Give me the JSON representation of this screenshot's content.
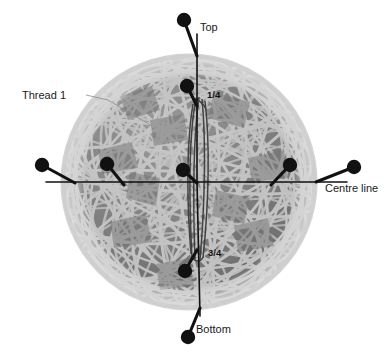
{
  "figure": {
    "type": "technical-illustration",
    "canvas": {
      "width": 391,
      "height": 363,
      "background": "#ffffff"
    }
  },
  "ball": {
    "name": "wound-ball",
    "center": {
      "x": 189,
      "y": 182
    },
    "radius": 127,
    "base_color": "#7b7b7b",
    "strand_color": "#c9c9c9",
    "highlight_color": "#d7d7d7",
    "shadow_color": "#6a6a6a",
    "rim_color": "#bfbfbf"
  },
  "axes": {
    "vertical": {
      "name": "vertical-axis",
      "label_top": "Top",
      "label_bottom": "Bottom",
      "color": "#111111"
    },
    "horizontal": {
      "name": "centre-line-axis",
      "label": "Centre line",
      "color": "#111111"
    }
  },
  "labels": {
    "top": "Top",
    "bottom": "Bottom",
    "centre_line": "Centre line",
    "thread_1": "Thread 1",
    "quarter": "1/4",
    "three_quarter": "3/4"
  },
  "pins": [
    {
      "name": "pin-top",
      "head": {
        "x": 184,
        "y": 20
      },
      "tip": {
        "x": 197,
        "y": 56
      },
      "label": "Top"
    },
    {
      "name": "pin-quarter",
      "head": {
        "x": 187,
        "y": 86
      },
      "tip": {
        "x": 197,
        "y": 106
      },
      "label": "1/4"
    },
    {
      "name": "pin-centre",
      "head": {
        "x": 183,
        "y": 170
      },
      "tip": {
        "x": 197,
        "y": 183
      },
      "label": ""
    },
    {
      "name": "pin-three-quarter",
      "head": {
        "x": 185,
        "y": 271
      },
      "tip": {
        "x": 197,
        "y": 250
      },
      "label": "3/4"
    },
    {
      "name": "pin-bottom",
      "head": {
        "x": 188,
        "y": 337
      },
      "tip": {
        "x": 200,
        "y": 308
      },
      "label": "Bottom"
    },
    {
      "name": "pin-left-outer",
      "head": {
        "x": 42,
        "y": 165
      },
      "tip": {
        "x": 72,
        "y": 182
      },
      "label": ""
    },
    {
      "name": "pin-left-inner",
      "head": {
        "x": 107,
        "y": 164
      },
      "tip": {
        "x": 124,
        "y": 184
      },
      "label": ""
    },
    {
      "name": "pin-right-inner",
      "head": {
        "x": 290,
        "y": 165
      },
      "tip": {
        "x": 271,
        "y": 184
      },
      "label": ""
    },
    {
      "name": "pin-right-outer",
      "head": {
        "x": 354,
        "y": 167
      },
      "tip": {
        "x": 318,
        "y": 182
      },
      "label": "Centre line"
    }
  ],
  "annotations": [
    {
      "name": "thread-1-callout",
      "text": "Thread 1",
      "text_x": 22,
      "text_y": 96,
      "leader_from": {
        "x": 88,
        "y": 96
      },
      "leader_to": {
        "x": 150,
        "y": 124
      }
    }
  ],
  "label_positions": {
    "top": {
      "x": 200,
      "y": 28
    },
    "bottom": {
      "x": 196,
      "y": 330
    },
    "centre_line": {
      "x": 325,
      "y": 189
    },
    "thread_1": {
      "x": 22,
      "y": 96
    },
    "quarter": {
      "x": 207,
      "y": 95
    },
    "three_quarter": {
      "x": 208,
      "y": 253
    }
  },
  "thread_bundle": {
    "name": "vertical-thread-bundle",
    "description": "dark thread loops running from the 1/4 pin down past centre to the 3/4 pin",
    "color": "#3a3a3a",
    "x_left": 191,
    "x_right": 205,
    "y_top": 97,
    "y_bottom": 262
  }
}
